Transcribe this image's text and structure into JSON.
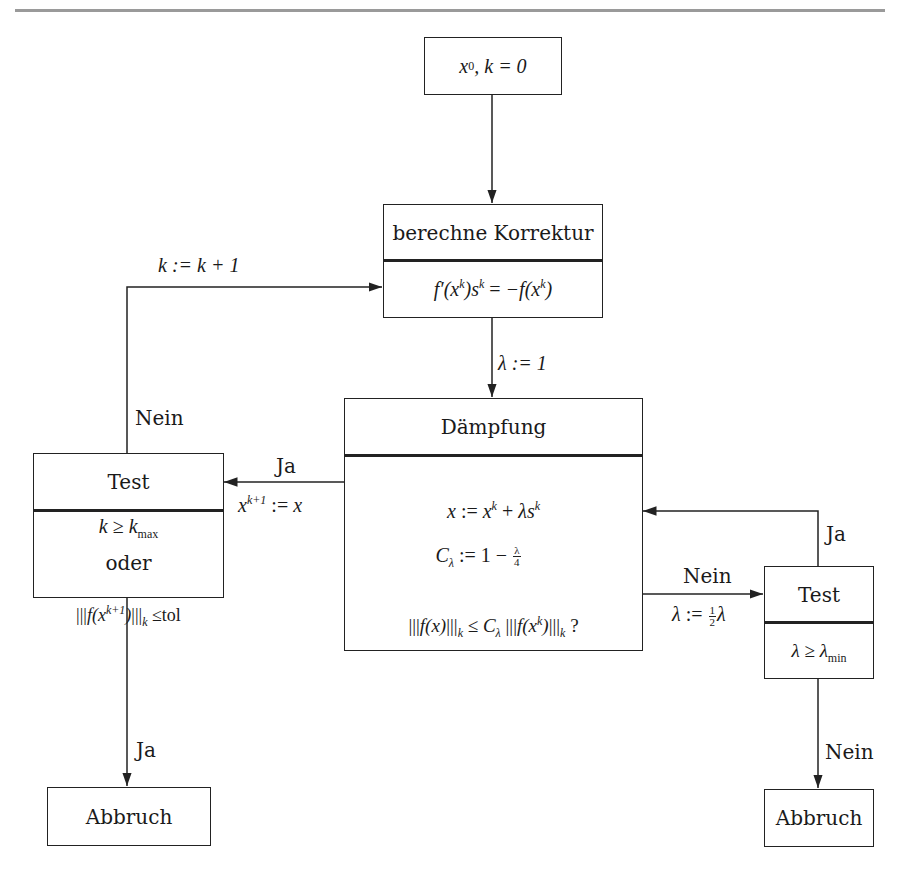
{
  "diagram": {
    "type": "flowchart",
    "nodes": {
      "start": {
        "text": "x^0, k = 0"
      },
      "korrektur": {
        "header": "berechne Korrektur",
        "body": "f'(x^k) s^k = -f(x^k)"
      },
      "daempfung": {
        "header": "Dämpfung",
        "lines": [
          "x := x^k + λ s^k",
          "C_λ := 1 - λ/4",
          "|||f(x)|||_k ≤ C_λ |||f(x^k)|||_k ?"
        ]
      },
      "test_left": {
        "header": "Test",
        "lines": [
          "k ≥ k_max",
          "oder",
          "|||f(x^{k+1})|||_k ≤tol"
        ]
      },
      "test_right": {
        "header": "Test",
        "body": "λ ≥ λ_min"
      },
      "abbruch_left": {
        "text": "Abbruch"
      },
      "abbruch_right": {
        "text": "Abbruch"
      }
    },
    "edges": [
      {
        "from": "start",
        "to": "korrektur",
        "label": ""
      },
      {
        "from": "korrektur",
        "to": "daempfung",
        "label": "λ := 1"
      },
      {
        "from": "daempfung",
        "to": "test_left",
        "label": "Ja",
        "sublabel": "x^{k+1} := x"
      },
      {
        "from": "daempfung",
        "to": "test_right",
        "label": "Nein",
        "sublabel": "λ := ½λ"
      },
      {
        "from": "test_right",
        "to": "daempfung",
        "label": "Ja"
      },
      {
        "from": "test_right",
        "to": "abbruch_right",
        "label": "Nein"
      },
      {
        "from": "test_left",
        "to": "korrektur",
        "label": "Nein",
        "sublabel": "k := k + 1"
      },
      {
        "from": "test_left",
        "to": "abbruch_left",
        "label": "Ja"
      }
    ]
  },
  "labels": {
    "start_x": "x",
    "start_sup": "0",
    "start_rest": ", k = 0",
    "korrektur_header": "berechne Korrektur",
    "daempfung_header": "Dämpfung",
    "test_header": "Test",
    "oder": "oder",
    "tol": "≤tol",
    "abbruch": "Abbruch",
    "ja": "Ja",
    "nein": "Nein",
    "lambda_init": "λ := 1",
    "k_increment": "k := k + 1",
    "frac_num_1": "1",
    "frac_den_2": "2",
    "frac_num_lambda": "λ",
    "frac_den_4": "4"
  }
}
